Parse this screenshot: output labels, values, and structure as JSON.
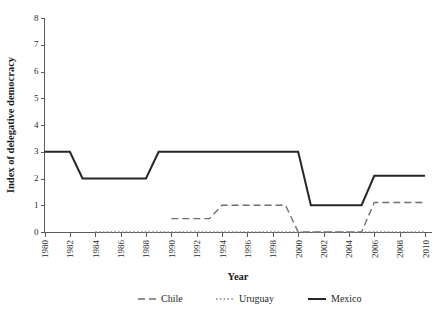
{
  "chart_data": {
    "type": "line",
    "title": "",
    "xlabel": "Year",
    "ylabel": "Index of delegative democracy",
    "xlim": [
      1980,
      2010
    ],
    "ylim": [
      0,
      8
    ],
    "grid": false,
    "legend_position": "bottom",
    "xticks": [
      "1980",
      "1982",
      "1984",
      "1986",
      "1988",
      "1990",
      "1992",
      "1994",
      "1996",
      "1998",
      "2000",
      "2002",
      "2004",
      "2006",
      "2008",
      "2010"
    ],
    "yticks": [
      "0",
      "1",
      "2",
      "3",
      "4",
      "5",
      "6",
      "7",
      "8"
    ],
    "x": [
      1980,
      1981,
      1982,
      1983,
      1984,
      1985,
      1986,
      1987,
      1988,
      1989,
      1990,
      1991,
      1992,
      1993,
      1994,
      1995,
      1996,
      1997,
      1998,
      1999,
      2000,
      2001,
      2002,
      2003,
      2004,
      2005,
      2006,
      2007,
      2008,
      2009,
      2010
    ],
    "series": [
      {
        "name": "Chile",
        "style": "dashed",
        "color": "#6e6e6e",
        "values": [
          null,
          null,
          null,
          null,
          null,
          null,
          null,
          null,
          null,
          null,
          0.5,
          0.5,
          0.5,
          0.5,
          1.0,
          1.0,
          1.0,
          1.0,
          1.0,
          1.0,
          0.0,
          0.0,
          0.0,
          0.0,
          0.0,
          0.0,
          1.1,
          1.1,
          1.1,
          1.1,
          1.1
        ]
      },
      {
        "name": "Uruguay",
        "style": "dotted",
        "color": "#8a8a8a",
        "values": [
          null,
          null,
          null,
          null,
          0.0,
          0.0,
          0.0,
          0.0,
          0.0,
          0.0,
          0.0,
          0.0,
          0.0,
          0.0,
          0.0,
          0.0,
          0.0,
          0.0,
          0.0,
          0.0,
          0.0,
          0.0,
          0.0,
          0.0,
          0.0,
          0.0,
          0.0,
          0.0,
          0.0,
          0.0,
          0.0
        ]
      },
      {
        "name": "Mexico",
        "style": "solid",
        "color": "#262626",
        "values": [
          3.0,
          3.0,
          3.0,
          2.0,
          2.0,
          2.0,
          2.0,
          2.0,
          2.0,
          3.0,
          3.0,
          3.0,
          3.0,
          3.0,
          3.0,
          3.0,
          3.0,
          3.0,
          3.0,
          3.0,
          3.0,
          1.0,
          1.0,
          1.0,
          1.0,
          1.0,
          2.1,
          2.1,
          2.1,
          2.1,
          2.1
        ]
      }
    ],
    "legend": [
      {
        "label": "Chile",
        "style": "dashed",
        "color": "#6e6e6e"
      },
      {
        "label": "Uruguay",
        "style": "dotted",
        "color": "#8a8a8a"
      },
      {
        "label": "Mexico",
        "style": "solid",
        "color": "#262626"
      }
    ],
    "axis_color": "#5b5b5b"
  }
}
